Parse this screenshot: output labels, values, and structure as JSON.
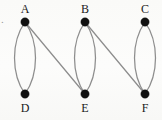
{
  "figure": {
    "background_color": "#fbfbfa",
    "edge_color": "#8d8d8d",
    "vertex_color": "#111111",
    "label_color": "#1a1a1a",
    "corner_mark": "."
  },
  "chart_data": {
    "type": "diagram",
    "title": "",
    "layout": "two-row bipartite multigraph",
    "grid": false,
    "legend": null,
    "vertices": [
      {
        "id": "A",
        "label": "A",
        "x": 25,
        "y": 22,
        "row": "top",
        "label_position": "above",
        "radius": 4.2
      },
      {
        "id": "B",
        "label": "B",
        "x": 85,
        "y": 22,
        "row": "top",
        "label_position": "above",
        "radius": 4.2
      },
      {
        "id": "C",
        "label": "C",
        "x": 145,
        "y": 22,
        "row": "top",
        "label_position": "above",
        "radius": 4.2
      },
      {
        "id": "D",
        "label": "D",
        "x": 25,
        "y": 94,
        "row": "bottom",
        "label_position": "below",
        "radius": 4.2
      },
      {
        "id": "E",
        "label": "E",
        "x": 85,
        "y": 94,
        "row": "bottom",
        "label_position": "below",
        "radius": 4.2
      },
      {
        "id": "F",
        "label": "F",
        "x": 145,
        "y": 94,
        "row": "bottom",
        "label_position": "below",
        "radius": 4.2
      }
    ],
    "edges": [
      {
        "id": "AD-left",
        "from": "A",
        "to": "D",
        "shape": "curve",
        "bow": -13,
        "multiplicity_index": 1,
        "path": "M 25 22 C 11 42, 11 74, 25 94"
      },
      {
        "id": "AD-right",
        "from": "A",
        "to": "D",
        "shape": "curve",
        "bow": 13,
        "multiplicity_index": 2,
        "path": "M 25 22 C 39 42, 39 74, 25 94"
      },
      {
        "id": "AE",
        "from": "A",
        "to": "E",
        "shape": "straight",
        "bow": 0,
        "multiplicity_index": 1,
        "path": "M 25 22 L 85 94"
      },
      {
        "id": "BE-left",
        "from": "B",
        "to": "E",
        "shape": "curve",
        "bow": -13,
        "multiplicity_index": 1,
        "path": "M 85 22 C 71 42, 71 74, 85 94"
      },
      {
        "id": "BE-right",
        "from": "B",
        "to": "E",
        "shape": "curve",
        "bow": 13,
        "multiplicity_index": 2,
        "path": "M 85 22 C 99 42, 99 74, 85 94"
      },
      {
        "id": "BF",
        "from": "B",
        "to": "F",
        "shape": "straight",
        "bow": 0,
        "multiplicity_index": 1,
        "path": "M 85 22 L 145 94"
      },
      {
        "id": "CF-left",
        "from": "C",
        "to": "F",
        "shape": "curve",
        "bow": -13,
        "multiplicity_index": 1,
        "path": "M 145 22 C 131 42, 131 74, 145 94"
      },
      {
        "id": "CF-right",
        "from": "C",
        "to": "F",
        "shape": "curve",
        "bow": 13,
        "multiplicity_index": 2,
        "path": "M 145 22 C 159 42, 159 74, 145 94"
      }
    ],
    "vertex_count": 6,
    "edge_count": 8,
    "degrees": {
      "A": 3,
      "B": 3,
      "C": 2,
      "D": 2,
      "E": 3,
      "F": 3
    }
  },
  "labels": {
    "A": "A",
    "B": "B",
    "C": "C",
    "D": "D",
    "E": "E",
    "F": "F"
  }
}
